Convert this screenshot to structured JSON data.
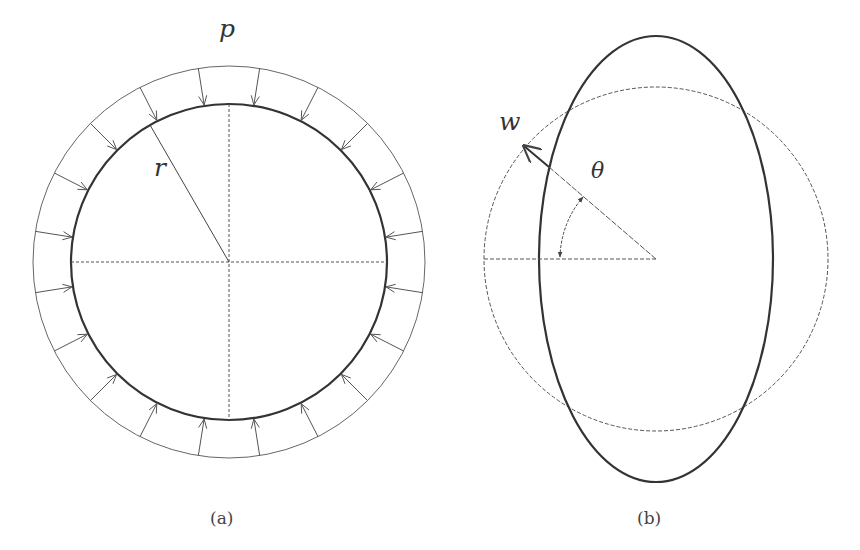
{
  "figure_a": {
    "caption": "(a)",
    "pressure_label": "p",
    "radius_label": "r",
    "center": [
      229,
      262
    ],
    "inner_radius": 158,
    "outer_radius": 196,
    "arrow_count": 20
  },
  "figure_b": {
    "caption": "(b)",
    "displacement_label": "w",
    "angle_label": "θ",
    "center": [
      656,
      259
    ],
    "circle_radius": 172,
    "ellipse_rx": 117,
    "ellipse_ry": 223,
    "angle_deg": 40.6
  },
  "colors": {
    "stroke": "#3a3a3a",
    "light_stroke": "#555555",
    "background": "#ffffff"
  }
}
